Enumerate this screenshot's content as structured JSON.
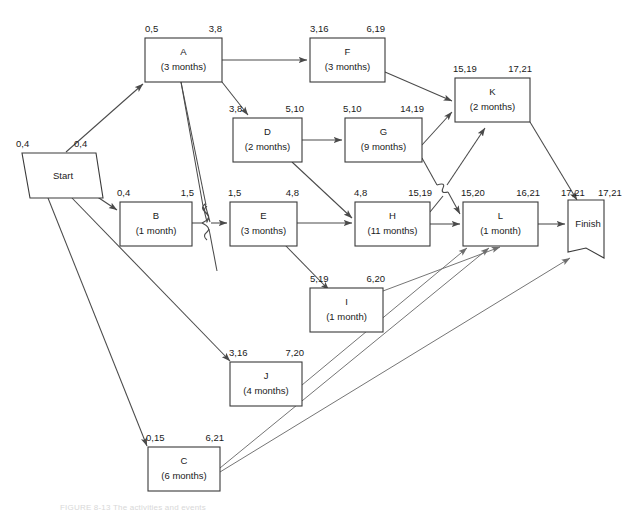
{
  "diagram": {
    "type": "pert-cpm-network",
    "caption": "FIGURE 8-13   The activities and events",
    "colors": {
      "line": "#4a4a4a",
      "box_stroke": "#3a3a3a",
      "text": "#1a1a1a",
      "background": "#ffffff"
    },
    "terminals": [
      {
        "id": "start",
        "label": "Start",
        "early": "0,4",
        "late": "0,4"
      },
      {
        "id": "finish",
        "label": "Finish",
        "early": "17,21",
        "late": "17,21"
      }
    ],
    "nodes": [
      {
        "id": "A",
        "label": "A",
        "duration": "(3 months)",
        "early": "0,5",
        "late": "3,8"
      },
      {
        "id": "B",
        "label": "B",
        "duration": "(1 month)",
        "early": "0,4",
        "late": "1,5"
      },
      {
        "id": "C",
        "label": "C",
        "duration": "(6 months)",
        "early": "0,15",
        "late": "6,21"
      },
      {
        "id": "D",
        "label": "D",
        "duration": "(2 months)",
        "early": "3,8",
        "late": "5,10"
      },
      {
        "id": "E",
        "label": "E",
        "duration": "(3 months)",
        "early": "1,5",
        "late": "4,8"
      },
      {
        "id": "F",
        "label": "F",
        "duration": "(3 months)",
        "early": "3,16",
        "late": "6,19"
      },
      {
        "id": "G",
        "label": "G",
        "duration": "(9 months)",
        "early": "5,10",
        "late": "14,19"
      },
      {
        "id": "H",
        "label": "H",
        "duration": "(11 months)",
        "early": "4,8",
        "late": "15,19"
      },
      {
        "id": "I",
        "label": "I",
        "duration": "(1 month)",
        "early": "5,19",
        "late": "6,20"
      },
      {
        "id": "J",
        "label": "J",
        "duration": "(4 months)",
        "early": "3,16",
        "late": "7,20"
      },
      {
        "id": "K",
        "label": "K",
        "duration": "(2 months)",
        "early": "15,19",
        "late": "17,21"
      },
      {
        "id": "L",
        "label": "L",
        "duration": "(1 month)",
        "early": "15,20",
        "late": "16,21"
      }
    ],
    "edges": [
      {
        "from": "start",
        "to": "A"
      },
      {
        "from": "start",
        "to": "B"
      },
      {
        "from": "start",
        "to": "J"
      },
      {
        "from": "start",
        "to": "C"
      },
      {
        "from": "A",
        "to": "F"
      },
      {
        "from": "A",
        "to": "D"
      },
      {
        "from": "A",
        "to": "E"
      },
      {
        "from": "B",
        "to": "E"
      },
      {
        "from": "D",
        "to": "G"
      },
      {
        "from": "D",
        "to": "H"
      },
      {
        "from": "E",
        "to": "H"
      },
      {
        "from": "E",
        "to": "I"
      },
      {
        "from": "F",
        "to": "K"
      },
      {
        "from": "G",
        "to": "K"
      },
      {
        "from": "G",
        "to": "L"
      },
      {
        "from": "H",
        "to": "L"
      },
      {
        "from": "H",
        "to": "K"
      },
      {
        "from": "I",
        "to": "L"
      },
      {
        "from": "J",
        "to": "L"
      },
      {
        "from": "C",
        "to": "L"
      },
      {
        "from": "C",
        "to": "finish"
      },
      {
        "from": "K",
        "to": "finish"
      },
      {
        "from": "L",
        "to": "finish"
      }
    ]
  }
}
